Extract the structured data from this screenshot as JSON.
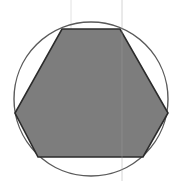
{
  "canvas": {
    "width": 181,
    "height": 181,
    "background_color": "#ffffff",
    "description": "Gray filled hexagon inscribed in a thin outlined circle"
  },
  "figure": {
    "title": "",
    "shapes": [
      {
        "name": "circumscribed-circle",
        "type": "circle",
        "center_x": 91,
        "center_y": 99,
        "radius": 77,
        "fill": "none",
        "stroke_color": "#5a5a5a",
        "stroke_width": 1.4
      },
      {
        "name": "inscribed-hexagon",
        "type": "polygon",
        "sides": 6,
        "points": "62,29 120,29 168,113 143,157 38,157 15,113",
        "vertices": [
          {
            "label": "top-left",
            "x": 62,
            "y": 29
          },
          {
            "label": "top-right",
            "x": 120,
            "y": 29
          },
          {
            "label": "right",
            "x": 168,
            "y": 113
          },
          {
            "label": "bottom-right",
            "x": 143,
            "y": 157
          },
          {
            "label": "bottom-left",
            "x": 38,
            "y": 157
          },
          {
            "label": "left",
            "x": 15,
            "y": 113
          }
        ],
        "fill_color": "#7d7d7d",
        "stroke_color": "#2b2b2b",
        "stroke_width": 1.6
      },
      {
        "name": "vertical-guide-line",
        "type": "line",
        "x1": 122,
        "y1": 0,
        "x2": 122,
        "y2": 181,
        "stroke_color": "#9c9c9c",
        "stroke_width": 0.8,
        "opacity": 0.55
      },
      {
        "name": "vertical-guide-line-upper",
        "type": "line",
        "x1": 71,
        "y1": 0,
        "x2": 71,
        "y2": 30,
        "stroke_color": "#d8d8d8",
        "stroke_width": 0.8,
        "opacity": 0.9
      }
    ]
  },
  "chart_data": {
    "type": "diagram",
    "title": "",
    "xlabel": "",
    "ylabel": "",
    "elements": [
      {
        "shape": "circle",
        "role": "circumscribed boundary",
        "fill": "none",
        "stroke": "#5a5a5a"
      },
      {
        "shape": "hexagon",
        "role": "inscribed filled polygon",
        "fill": "#7d7d7d",
        "stroke": "#2b2b2b"
      },
      {
        "shape": "line",
        "role": "faint vertical guide",
        "stroke": "#9c9c9c"
      }
    ],
    "legend": [],
    "annotations": []
  }
}
